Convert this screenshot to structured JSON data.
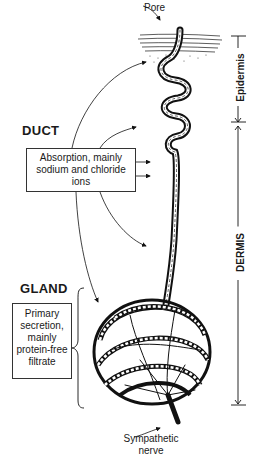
{
  "diagram": {
    "labels": {
      "pore": "Pore",
      "duct_heading": "DUCT",
      "duct_box": "Absorption, mainly sodium and chloride ions",
      "gland_heading": "GLAND",
      "gland_box": "Primary secretion, mainly protein-free filtrate",
      "nerve": "Sympathetic nerve",
      "epidermis": "Epidermis",
      "dermis": "DERMIS"
    },
    "icons": [
      "arrow-icon",
      "brace-icon",
      "dimension-arrow-icon"
    ],
    "colors": {
      "ink": "#1a1a1a",
      "background": "#ffffff"
    }
  }
}
